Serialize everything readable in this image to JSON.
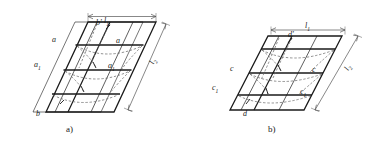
{
  "figure": {
    "type": "engineering-line-diagram",
    "background_color": "#ffffff",
    "line_color": "#1a1a1a",
    "dashed_color": "#6b6b6b",
    "dimension_color": "#555555"
  },
  "panel_a": {
    "caption": "a)",
    "dimension_top": "l",
    "dimension_top_sub": "1",
    "dimension_right": "l",
    "dimension_right_sub": "2",
    "labels": {
      "top_node": "b'",
      "upper_left": "a",
      "upper_right": "a",
      "mid_left": "a",
      "mid_left_sub": "1",
      "mid_right": "a",
      "mid_right_sub": "1",
      "bottom_node": "b"
    }
  },
  "panel_b": {
    "caption": "b)",
    "dimension_top": "l",
    "dimension_top_sub": "1",
    "dimension_right": "l",
    "dimension_right_sub": "2",
    "labels": {
      "top_node": "d'",
      "mid_left": "c",
      "mid_right": "c",
      "lower_left": "c",
      "lower_left_sub": "1",
      "lower_right": "c",
      "lower_right_sub": "1",
      "bottom_node": "d"
    }
  }
}
